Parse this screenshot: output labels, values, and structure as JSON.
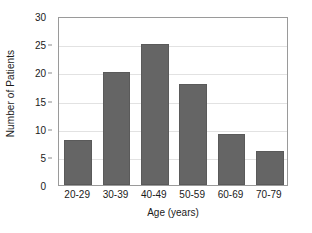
{
  "chart_data": {
    "type": "bar",
    "title": "",
    "categories": [
      "20-29",
      "30-39",
      "40-49",
      "50-59",
      "60-69",
      "70-79"
    ],
    "values": [
      8,
      20,
      25,
      18,
      9,
      6
    ],
    "xlabel": "Age (years)",
    "ylabel": "Number of Patients",
    "ylim": [
      0,
      30
    ],
    "yticks": [
      0,
      5,
      10,
      15,
      20,
      25,
      30
    ],
    "ytick_labels": [
      "0",
      "5",
      "10",
      "15",
      "20",
      "25",
      "30"
    ],
    "grid": true,
    "legend": false,
    "bar_color": "#656565",
    "bar_edge_color": "#5a5a5a",
    "gridline_color": "#e2e2e2",
    "frame_color": "#9a9a9a",
    "background_color": "#ffffff",
    "text_color": "#1a1a1a"
  }
}
